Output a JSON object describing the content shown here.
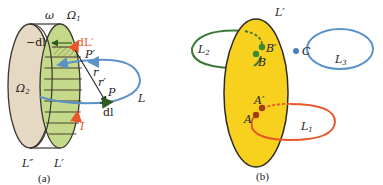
{
  "panel_a": {
    "caption": "(a)",
    "labels": {
      "omega": "ω",
      "omega1": "Ω",
      "omega1_sub": "1",
      "omega2": "Ω",
      "omega2_sub": "2",
      "minus_dl": "−dl",
      "dL_prime": "dL′",
      "P_prime": "P′",
      "r": "r",
      "r_prime": "r′",
      "P": "P",
      "L": "L",
      "dl": "dl",
      "I": "I",
      "L_double_prime": "L″",
      "L_prime": "L′"
    },
    "colors": {
      "left_disk": "#e6d9c3",
      "right_disk": "#c5d98a",
      "loop": "#5b93c9",
      "current": "#e8572a",
      "outline": "#3a3530"
    }
  },
  "panel_b": {
    "caption": "(b)",
    "labels": {
      "L_prime": "L′",
      "L2": "L",
      "L2_sub": "2",
      "B_prime": "B′",
      "B": "B",
      "C": "C",
      "L3": "L",
      "L3_sub": "3",
      "A_prime": "A′",
      "A": "A",
      "L1": "L",
      "L1_sub": "1"
    },
    "colors": {
      "surface": "#f7d11e",
      "L1": "#e8572a",
      "L2": "#3d7a3a",
      "L3": "#5b93c9",
      "point_A": "#a33a1c",
      "point_B": "#3d8a35",
      "point_C": "#4a7fbf"
    }
  }
}
